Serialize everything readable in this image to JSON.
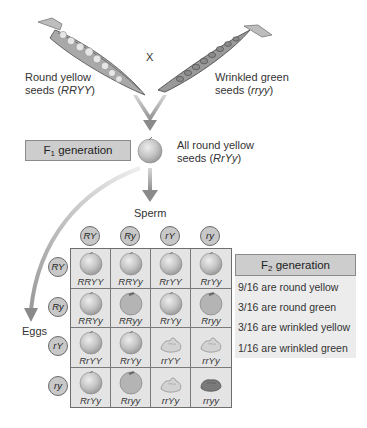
{
  "diagram": {
    "parents": {
      "left": {
        "line1": "Round yellow",
        "line2_prefix": "seeds (",
        "genotype": "RRYY",
        "line2_suffix": ")"
      },
      "cross_symbol": "X",
      "right": {
        "line1": "Wrinkled green",
        "line2_prefix": "seeds (",
        "genotype": "rryy",
        "line2_suffix": ")"
      }
    },
    "f1": {
      "box_label_prefix": "F",
      "box_label_sub": "1",
      "box_label_suffix": " generation",
      "description_line1": "All round yellow",
      "description_line2_prefix": "seeds (",
      "genotype": "RrYy",
      "description_line2_suffix": ")"
    },
    "sperm_label": "Sperm",
    "eggs_label": "Eggs",
    "sperm_gametes": [
      "RY",
      "Ry",
      "rY",
      "ry"
    ],
    "egg_gametes": [
      "RY",
      "Ry",
      "rY",
      "ry"
    ],
    "punnett": {
      "rows": [
        [
          {
            "genotype": "RRYY",
            "phenotype": "round-yellow"
          },
          {
            "genotype": "RRYy",
            "phenotype": "round-yellow"
          },
          {
            "genotype": "RrYY",
            "phenotype": "round-yellow"
          },
          {
            "genotype": "RrYy",
            "phenotype": "round-yellow"
          }
        ],
        [
          {
            "genotype": "RRYy",
            "phenotype": "round-yellow"
          },
          {
            "genotype": "RRyy",
            "phenotype": "round-green"
          },
          {
            "genotype": "RrYy",
            "phenotype": "round-yellow"
          },
          {
            "genotype": "Rryy",
            "phenotype": "round-green"
          }
        ],
        [
          {
            "genotype": "RrYY",
            "phenotype": "round-yellow"
          },
          {
            "genotype": "RrYy",
            "phenotype": "round-yellow"
          },
          {
            "genotype": "rrYY",
            "phenotype": "wrinkled-yellow"
          },
          {
            "genotype": "rrYy",
            "phenotype": "wrinkled-yellow"
          }
        ],
        [
          {
            "genotype": "RrYy",
            "phenotype": "round-yellow"
          },
          {
            "genotype": "Rryy",
            "phenotype": "round-green"
          },
          {
            "genotype": "rrYy",
            "phenotype": "wrinkled-yellow"
          },
          {
            "genotype": "rryy",
            "phenotype": "wrinkled-green"
          }
        ]
      ]
    },
    "f2": {
      "box_label_prefix": "F",
      "box_label_sub": "2",
      "box_label_suffix": " generation",
      "ratios": [
        "9/16 are round yellow",
        "3/16 are round green",
        "3/16 are wrinkled yellow",
        "1/16 are wrinkled green"
      ]
    },
    "colors": {
      "box_fill": "#cdcdcd",
      "panel_fill": "#ececec",
      "grid_fill": "#e4e4e4",
      "seed_round": "#c2c2c2",
      "seed_wrinkled_light": "#c8c8c8",
      "seed_wrinkled_dark": "#7a7a7a",
      "arrow": "#9a9a9a"
    }
  }
}
